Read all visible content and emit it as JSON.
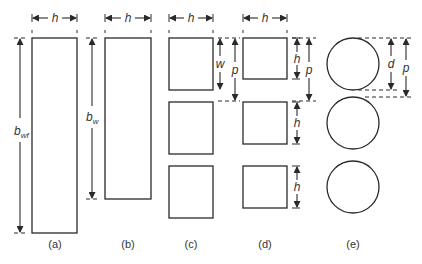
{
  "figure": {
    "panels": [
      {
        "id": "a",
        "caption": "(a)",
        "shape": "rectangle",
        "width_label": "h",
        "height_label": "b",
        "height_label_sub": "wf"
      },
      {
        "id": "b",
        "caption": "(b)",
        "shape": "rectangle",
        "width_label": "h",
        "height_label": "b",
        "height_label_sub": "w"
      },
      {
        "id": "c",
        "caption": "(c)",
        "shape": "squares",
        "count": 3,
        "width_label": "h",
        "dim1_label": "w",
        "dim2_label": "p"
      },
      {
        "id": "d",
        "caption": "(d)",
        "shape": "squares",
        "count": 3,
        "width_label": "h",
        "dim_left_label": "p",
        "dim_side_labels": [
          "h",
          "h",
          "h"
        ],
        "dim_right_label": "p"
      },
      {
        "id": "e",
        "caption": "(e)",
        "shape": "circles",
        "count": 3,
        "dim1_label": "d",
        "dim2_label": "p"
      }
    ]
  },
  "colors": {
    "stroke": "#2a2a2a",
    "background": "#ffffff"
  }
}
